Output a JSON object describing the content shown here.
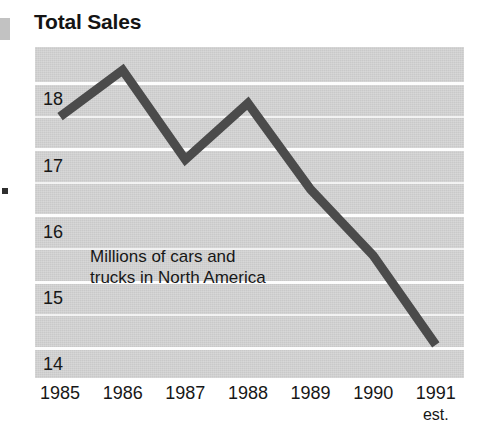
{
  "figure": {
    "title": "Total Sales",
    "annotation_line1": "Millions of cars and",
    "annotation_line2": "trucks in North America",
    "background_color": "#ffffff",
    "plot_background_color": "#c9c9c9",
    "gridline_color": "#fdfdfd",
    "line_color": "#4b4b4b",
    "text_color": "#171717"
  },
  "chart_data": {
    "type": "line",
    "title": "Total Sales",
    "subtitle": "Millions of cars and trucks in North America",
    "xlabel": "",
    "ylabel": "",
    "x": [
      "1985",
      "1986",
      "1987",
      "1988",
      "1989",
      "1990",
      "1991"
    ],
    "x_tick_sublabels": [
      "",
      "",
      "",
      "",
      "",
      "",
      "est."
    ],
    "values": [
      17.5,
      18.2,
      16.85,
      17.7,
      16.4,
      15.4,
      14.05
    ],
    "series": [
      {
        "name": "Total Sales",
        "values": [
          17.5,
          18.2,
          16.85,
          17.7,
          16.4,
          15.4,
          14.05
        ]
      }
    ],
    "ylim": [
      13.55,
      18.55
    ],
    "xlim": [
      1984.6,
      1991.45
    ],
    "y_ticks": [
      18,
      17,
      16,
      15,
      14
    ],
    "y_tick_labels": [
      "18",
      "17",
      "16",
      "15",
      "14"
    ],
    "y_minor_ticks": [
      17.5,
      16.5,
      15.5,
      14.5
    ],
    "grid": true,
    "grid_axis": "y",
    "legend": false,
    "legend_position": "none",
    "units": "millions of vehicles",
    "region": "North America",
    "note": "1991 value is an estimate"
  },
  "axes": {
    "y_labels": [
      "18",
      "17",
      "16",
      "15",
      "14"
    ],
    "x_labels": [
      {
        "label": "1985",
        "sub": ""
      },
      {
        "label": "1986",
        "sub": ""
      },
      {
        "label": "1987",
        "sub": ""
      },
      {
        "label": "1988",
        "sub": ""
      },
      {
        "label": "1989",
        "sub": ""
      },
      {
        "label": "1990",
        "sub": ""
      },
      {
        "label": "1991",
        "sub": "est."
      }
    ]
  }
}
